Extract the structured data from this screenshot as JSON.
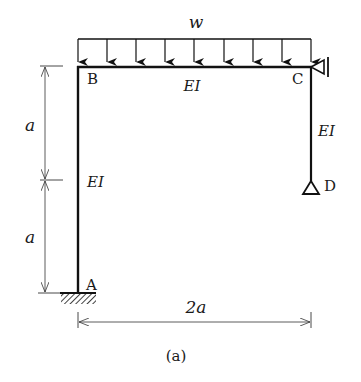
{
  "diagram": {
    "caption": "(a)",
    "load": {
      "label": "w",
      "type": "uniformly distributed load",
      "arrow_count": 9
    },
    "nodes": {
      "A": {
        "label": "A",
        "support": "fixed"
      },
      "B": {
        "label": "B"
      },
      "C": {
        "label": "C",
        "support": "roller (horizontal restraint)"
      },
      "D": {
        "label": "D",
        "support": "pin"
      }
    },
    "members": [
      {
        "id": "AB",
        "label": "EI"
      },
      {
        "id": "BC",
        "label": "EI"
      },
      {
        "id": "CD",
        "label": "EI"
      }
    ],
    "dimensions": {
      "left_upper": "a",
      "left_lower": "a",
      "bottom": "2a"
    }
  }
}
